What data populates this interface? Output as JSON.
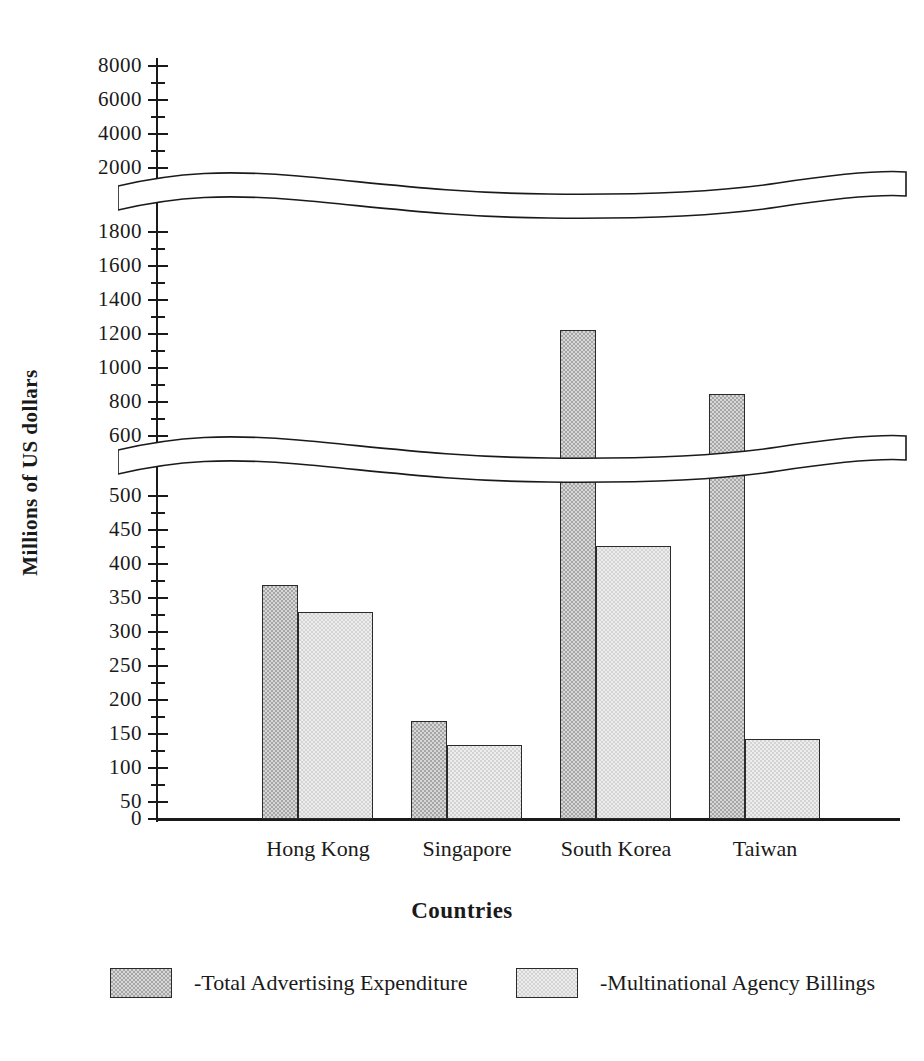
{
  "chart_data": {
    "type": "bar",
    "title": "",
    "xlabel": "Countries",
    "ylabel": "Millions of US dollars",
    "categories": [
      "Hong Kong",
      "Singapore",
      "South Korea",
      "Taiwan"
    ],
    "series": [
      {
        "name": "-Total Advertising Expenditure",
        "legend_label": "-Total Advertising Expenditure",
        "swatch": "dark-checkered",
        "color": "#a6a6a6",
        "values": [
          360,
          160,
          1190,
          810
        ]
      },
      {
        "name": "-Multinational Agency Billings",
        "legend_label": "-Multinational Agency Billings",
        "swatch": "light-checkered",
        "color": "#ededed",
        "values": [
          320,
          120,
          425,
          132
        ]
      }
    ],
    "grid": false,
    "legend_position": "bottom",
    "axis_breaks": [
      {
        "after": 500,
        "before": 600
      },
      {
        "after": 2000,
        "before": 2000
      }
    ],
    "y_tick_labels": [
      "8000",
      "6000",
      "4000",
      "2000",
      "1800",
      "1600",
      "1400",
      "1200",
      "1000",
      "800",
      "600",
      "500",
      "450",
      "400",
      "350",
      "300",
      "250",
      "200",
      "150",
      "100",
      "50",
      "0"
    ],
    "y_ticks_upper": [
      8000,
      6000,
      4000,
      2000
    ],
    "y_ticks_middle": [
      1800,
      1600,
      1400,
      1200,
      1000,
      800,
      600
    ],
    "y_ticks_lower": [
      500,
      450,
      400,
      350,
      300,
      250,
      200,
      150,
      100,
      50,
      0
    ],
    "ylim_segments": [
      [
        0,
        500
      ],
      [
        600,
        2000
      ],
      [
        2000,
        8000
      ]
    ]
  },
  "axis": {
    "y_title": "Millions of US dollars",
    "x_title": "Countries",
    "ticks": [
      {
        "label": "8000",
        "y": 66,
        "minor_y": 83
      },
      {
        "label": "6000",
        "y": 100,
        "minor_y": 117
      },
      {
        "label": "4000",
        "y": 134,
        "minor_y": 151
      },
      {
        "label": "2000",
        "y": 168,
        "minor_y": 0
      },
      {
        "label": "1800",
        "y": 232,
        "minor_y": 249
      },
      {
        "label": "1600",
        "y": 266,
        "minor_y": 283
      },
      {
        "label": "1400",
        "y": 300,
        "minor_y": 317
      },
      {
        "label": "1200",
        "y": 334,
        "minor_y": 351
      },
      {
        "label": "1000",
        "y": 368,
        "minor_y": 385
      },
      {
        "label": "800",
        "y": 402,
        "minor_y": 419
      },
      {
        "label": "600",
        "y": 436,
        "minor_y": 0
      },
      {
        "label": "500",
        "y": 496,
        "minor_y": 513
      },
      {
        "label": "450",
        "y": 530,
        "minor_y": 547
      },
      {
        "label": "400",
        "y": 564,
        "minor_y": 581
      },
      {
        "label": "350",
        "y": 598,
        "minor_y": 615
      },
      {
        "label": "300",
        "y": 632,
        "minor_y": 649
      },
      {
        "label": "250",
        "y": 666,
        "minor_y": 683
      },
      {
        "label": "200",
        "y": 700,
        "minor_y": 717
      },
      {
        "label": "150",
        "y": 734,
        "minor_y": 751
      },
      {
        "label": "100",
        "y": 768,
        "minor_y": 785
      },
      {
        "label": "50",
        "y": 802,
        "minor_y": 0
      },
      {
        "label": "0",
        "y": 819,
        "minor_y": 0
      }
    ]
  },
  "bars": [
    {
      "category": "Hong Kong",
      "series": "total",
      "value": 360,
      "x": 262,
      "width": 36,
      "top": 585,
      "height": 234
    },
    {
      "category": "Hong Kong",
      "series": "multinational",
      "value": 320,
      "x": 298,
      "width": 75,
      "top": 612,
      "height": 207
    },
    {
      "category": "Singapore",
      "series": "total",
      "value": 160,
      "x": 411,
      "width": 36,
      "top": 721,
      "height": 98
    },
    {
      "category": "Singapore",
      "series": "multinational",
      "value": 120,
      "x": 447,
      "width": 75,
      "top": 745,
      "height": 74
    },
    {
      "category": "South Korea",
      "series": "total",
      "value": 1190,
      "x": 560,
      "width": 36,
      "top": 330,
      "height": 489
    },
    {
      "category": "South Korea",
      "series": "multinational",
      "value": 425,
      "x": 596,
      "width": 75,
      "top": 546,
      "height": 273
    },
    {
      "category": "Taiwan",
      "series": "total",
      "value": 810,
      "x": 709,
      "width": 36,
      "top": 394,
      "height": 425
    },
    {
      "category": "Taiwan",
      "series": "multinational",
      "value": 132,
      "x": 745,
      "width": 75,
      "top": 739,
      "height": 80
    }
  ],
  "category_labels": [
    {
      "label": "Hong Kong",
      "center": 318
    },
    {
      "label": "Singapore",
      "center": 467
    },
    {
      "label": "South Korea",
      "center": 616
    },
    {
      "label": "Taiwan",
      "center": 765
    }
  ],
  "legend": {
    "items": [
      {
        "label": "-Total Advertising Expenditure",
        "swatch": "dark"
      },
      {
        "label": "-Multinational Agency Billings",
        "swatch": "light"
      }
    ]
  }
}
